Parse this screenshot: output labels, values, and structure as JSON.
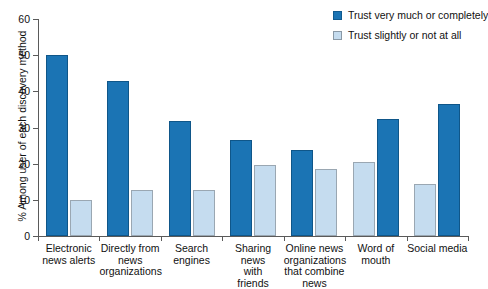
{
  "chart_data": {
    "type": "bar",
    "title": "",
    "xlabel": "",
    "ylabel": "% Among user of each discovery method",
    "ylim": [
      0,
      60
    ],
    "ytick_labels": [
      "0",
      "10",
      "20",
      "30",
      "40",
      "50",
      "60"
    ],
    "ytick_values": [
      0,
      10,
      20,
      30,
      40,
      50,
      60
    ],
    "grid": false,
    "legend_position": "top-right",
    "categories": [
      "Electronic news alerts",
      "Directly from news organizations",
      "Search engines",
      "Sharing news with friends",
      "Online news organizations that combine news",
      "Word of mouth",
      "Social media"
    ],
    "category_lines": [
      [
        "Electronic",
        "news alerts"
      ],
      [
        "Directly from",
        "news",
        "organizations"
      ],
      [
        "Search",
        "engines"
      ],
      [
        "Sharing",
        "news",
        "with",
        "friends"
      ],
      [
        "Online news",
        "organizations",
        "that combine",
        "news"
      ],
      [
        "Word of",
        "mouth"
      ],
      [
        "Social media"
      ]
    ],
    "series": [
      {
        "name": "Trust very much or completely",
        "color": "#1b74b4",
        "values": [
          50.0,
          42.8,
          31.7,
          26.6,
          23.7,
          32.4,
          36.4
        ]
      },
      {
        "name": "Trust slightly or not at all",
        "color": "#c5dcef",
        "values": [
          10.0,
          12.7,
          12.6,
          19.6,
          18.4,
          20.6,
          14.4
        ]
      }
    ],
    "series_order_per_category": [
      [
        "dark",
        "light"
      ],
      [
        "dark",
        "light"
      ],
      [
        "dark",
        "light"
      ],
      [
        "dark",
        "light"
      ],
      [
        "dark",
        "light"
      ],
      [
        "light",
        "dark"
      ],
      [
        "light",
        "dark"
      ]
    ]
  },
  "legend": {
    "items": [
      {
        "label": "Trust very much or completely",
        "swatch": "dark"
      },
      {
        "label": "Trust slightly or not at all",
        "swatch": "light"
      }
    ]
  },
  "axis": {
    "y_title": "% Among user of each discovery method"
  },
  "colors": {
    "dark_blue": "#1b74b4",
    "light_blue": "#c5dcef",
    "axis": "#5a5a5a",
    "background": "#ffffff"
  }
}
